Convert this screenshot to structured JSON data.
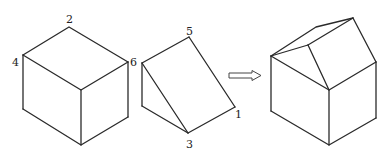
{
  "diagram": {
    "type": "geometry-solids-composition",
    "colors": {
      "line": "#2a2a2a",
      "background": "#ffffff"
    },
    "cube": {
      "labels": [
        {
          "text": "2",
          "x": 66,
          "y": 23
        },
        {
          "text": "4",
          "x": 12,
          "y": 66
        },
        {
          "text": "6",
          "x": 130,
          "y": 66
        }
      ]
    },
    "prism": {
      "labels": [
        {
          "text": "5",
          "x": 186,
          "y": 35
        },
        {
          "text": "1",
          "x": 235,
          "y": 118
        },
        {
          "text": "3",
          "x": 186,
          "y": 148
        }
      ]
    },
    "arrow": {
      "meaning": "combine-into",
      "direction": "right"
    },
    "house": {
      "description": "cube with triangular prism roof"
    }
  }
}
